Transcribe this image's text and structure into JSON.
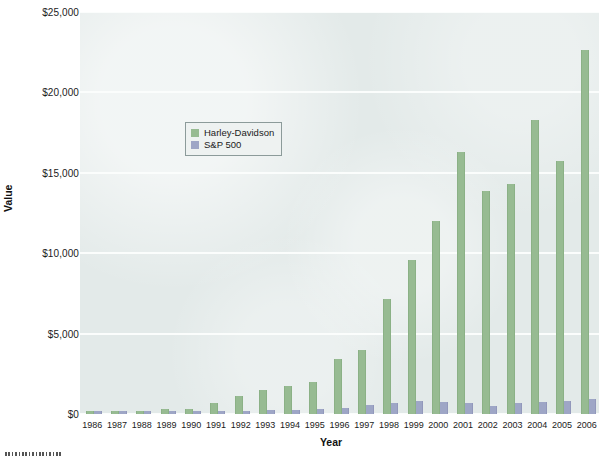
{
  "chart_data": {
    "type": "bar",
    "title": "",
    "subtitle": "",
    "xlabel": "Year",
    "ylabel": "Value",
    "grid": true,
    "legend_position": "inside-upper-left",
    "ylim": [
      0,
      25000
    ],
    "ytick_values": [
      0,
      5000,
      10000,
      15000,
      20000,
      25000
    ],
    "ytick_labels": [
      "$0",
      "$5,000",
      "$10,000",
      "$15,000",
      "$20,000",
      "$25,000"
    ],
    "categories": [
      "1986",
      "1987",
      "1988",
      "1989",
      "1990",
      "1991",
      "1992",
      "1993",
      "1994",
      "1995",
      "1996",
      "1997",
      "1998",
      "1999",
      "2000",
      "2001",
      "2002",
      "2003",
      "2004",
      "2005",
      "2006"
    ],
    "series": [
      {
        "name": "Harley-Davidson",
        "color": "#97bb92",
        "values": [
          100,
          150,
          200,
          320,
          290,
          700,
          1150,
          1500,
          1750,
          2000,
          3400,
          4000,
          7150,
          9600,
          12000,
          16300,
          13850,
          14300,
          18300,
          15750,
          22650
        ]
      },
      {
        "name": "S&P 500",
        "color": "#9ea6c6",
        "values": [
          100,
          105,
          120,
          160,
          155,
          200,
          215,
          235,
          240,
          330,
          405,
          540,
          695,
          840,
          765,
          675,
          525,
          675,
          750,
          785,
          910
        ]
      }
    ]
  },
  "legend": {
    "entries": [
      {
        "label": "Harley-Davidson",
        "swatch": "hd"
      },
      {
        "label": "S&P 500",
        "swatch": "sp"
      }
    ]
  },
  "axes": {
    "y_title": "Value",
    "x_title": "Year"
  },
  "colors": {
    "plot_background": "#e3eae9",
    "gridline": "#fbfdfc",
    "harley_davidson": "#97bb92",
    "sp500": "#9ea6c6",
    "page_background": "#ffffff",
    "text": "#1b1b1b"
  }
}
